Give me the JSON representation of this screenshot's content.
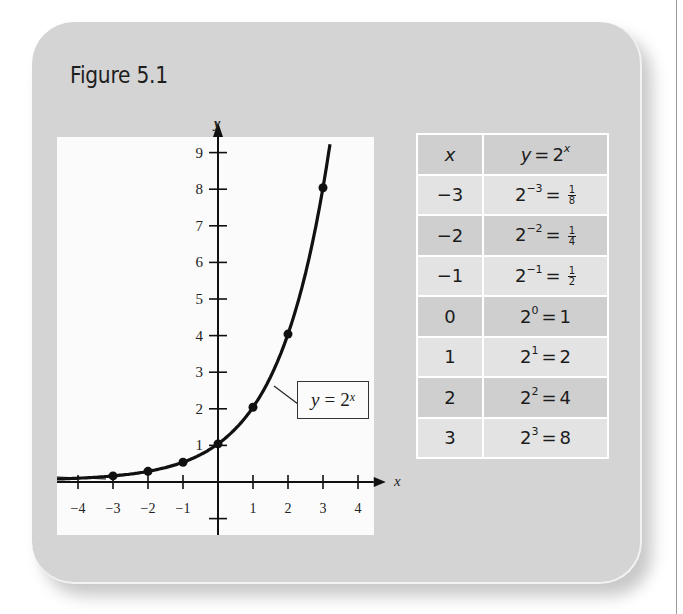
{
  "figure": {
    "title": "Figure 5.1"
  },
  "plot": {
    "x_axis_label": "x",
    "y_axis_label": "y",
    "x_tick_labels": [
      "−4",
      "−3",
      "−2",
      "−1",
      "1",
      "2",
      "3",
      "4"
    ],
    "y_tick_labels": [
      "1",
      "2",
      "3",
      "4",
      "5",
      "6",
      "7",
      "8",
      "9"
    ],
    "curve_label": {
      "lhs": "y",
      "equals": "=",
      "base": "2",
      "exponent": "x"
    }
  },
  "table": {
    "headers": {
      "x": "x",
      "y_lhs": "y",
      "y_equals": "=",
      "y_base": "2",
      "y_exp": "x"
    },
    "rows": [
      {
        "x": "−3",
        "base": "2",
        "exp": "−3",
        "eq": "=",
        "frac_num": "1",
        "frac_den": "8",
        "value": ""
      },
      {
        "x": "−2",
        "base": "2",
        "exp": "−2",
        "eq": "=",
        "frac_num": "1",
        "frac_den": "4",
        "value": ""
      },
      {
        "x": "−1",
        "base": "2",
        "exp": "−1",
        "eq": "=",
        "frac_num": "1",
        "frac_den": "2",
        "value": ""
      },
      {
        "x": "0",
        "base": "2",
        "exp": "0",
        "eq": "=",
        "value": "1"
      },
      {
        "x": "1",
        "base": "2",
        "exp": "1",
        "eq": "=",
        "value": "2"
      },
      {
        "x": "2",
        "base": "2",
        "exp": "2",
        "eq": "=",
        "value": "4"
      },
      {
        "x": "3",
        "base": "2",
        "exp": "3",
        "eq": "=",
        "value": "8"
      }
    ]
  },
  "colors": {
    "card_bg": "#d4d4d4",
    "plot_bg": "#fbfbfb",
    "table_dark_row": "#cfcfcf",
    "table_light_row": "#e3e3e3",
    "ink": "#111111"
  },
  "chart_data": {
    "type": "line",
    "title": "Figure 5.1",
    "xlabel": "x",
    "ylabel": "y",
    "xlim": [
      -4.5,
      4.5
    ],
    "ylim": [
      -1,
      9.5
    ],
    "x_ticks": [
      -4,
      -3,
      -2,
      -1,
      1,
      2,
      3,
      4
    ],
    "y_ticks": [
      1,
      2,
      3,
      4,
      5,
      6,
      7,
      8,
      9
    ],
    "grid": false,
    "series": [
      {
        "name": "y = 2^x",
        "function": "2^x",
        "marked_points": {
          "x": [
            -3,
            -2,
            -1,
            0,
            1,
            2,
            3
          ],
          "y": [
            0.125,
            0.25,
            0.5,
            1,
            2,
            4,
            8
          ]
        }
      }
    ],
    "annotations": [
      "y = 2^x (curve label box)"
    ],
    "table": {
      "columns": [
        "x",
        "y = 2^x"
      ],
      "rows": [
        [
          "-3",
          "2^-3 = 1/8"
        ],
        [
          "-2",
          "2^-2 = 1/4"
        ],
        [
          "-1",
          "2^-1 = 1/2"
        ],
        [
          "0",
          "2^0 = 1"
        ],
        [
          "1",
          "2^1 = 2"
        ],
        [
          "2",
          "2^2 = 4"
        ],
        [
          "3",
          "2^3 = 8"
        ]
      ]
    }
  }
}
